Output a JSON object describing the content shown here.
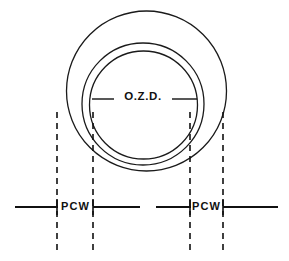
{
  "diagram": {
    "background_color": "#ffffff",
    "stroke_color": "#111111",
    "labels": {
      "ozd": "O.Z.D.",
      "pcw_left": "PCW",
      "pcw_right": "PCW"
    },
    "circles": [
      {
        "name": "outer-circle",
        "cx": 146.5,
        "cy": 91,
        "r": 80,
        "stroke_width": 1.3
      },
      {
        "name": "middle-circle",
        "cx": 143,
        "cy": 104,
        "r": 61,
        "stroke_width": 1.3
      },
      {
        "name": "inner-circle",
        "cx": 143.5,
        "cy": 105,
        "r": 54,
        "stroke_width": 1.3
      }
    ],
    "ozd_dimension": {
      "label": "O.Z.D.",
      "label_x": 143,
      "label_y": 97,
      "leader_y": 99,
      "left_leader": {
        "x1": 92,
        "x2": 114
      },
      "right_leader": {
        "x1": 172,
        "x2": 197
      },
      "stroke_width": 1.4
    },
    "baseline": {
      "y": 207,
      "stroke_width": 1.9,
      "segments": [
        {
          "name": "baseline-segment-1",
          "x1": 15,
          "x2": 58
        },
        {
          "name": "baseline-segment-2",
          "x1": 93,
          "x2": 140
        },
        {
          "name": "baseline-segment-3",
          "x1": 156,
          "x2": 191
        },
        {
          "name": "baseline-segment-4",
          "x1": 223,
          "x2": 278
        }
      ]
    },
    "dashed_lines": [
      {
        "name": "dashed-line-outer-left",
        "x": 57,
        "y1": 112,
        "y2": 251,
        "stroke_width": 1.6
      },
      {
        "name": "dashed-line-inner-left",
        "x": 93,
        "y1": 112,
        "y2": 251,
        "stroke_width": 1.6
      },
      {
        "name": "dashed-line-inner-right",
        "x": 190,
        "y1": 112,
        "y2": 251,
        "stroke_width": 1.6
      },
      {
        "name": "dashed-line-outer-right",
        "x": 223,
        "y1": 112,
        "y2": 251,
        "stroke_width": 1.6
      }
    ],
    "pcw_dimensions": [
      {
        "name": "pcw-left",
        "label": "PCW",
        "label_x": 75.5,
        "label_y": 207,
        "tick_left_x": 57,
        "tick_right_x": 93,
        "tick_y1": 199,
        "tick_y2": 215,
        "stroke_width": 1.6
      },
      {
        "name": "pcw-right",
        "label": "PCW",
        "label_x": 206.5,
        "label_y": 207,
        "tick_left_x": 190,
        "tick_right_x": 223,
        "tick_y1": 199,
        "tick_y2": 215,
        "stroke_width": 1.6
      }
    ]
  }
}
